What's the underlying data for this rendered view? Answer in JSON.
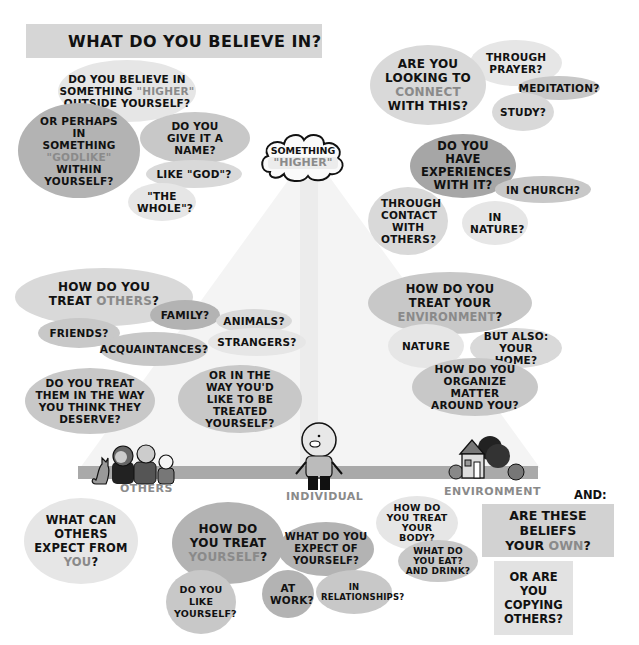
{
  "title": "WHAT DO YOU BELIEVE IN?",
  "colors": {
    "bubble_light": "#e6e6e6",
    "bubble_mid": "#c8c8c8",
    "bubble_dark": "#a6a6a6",
    "highlight_text": "#8a8a8a",
    "base_bar": "#a9a9a9"
  },
  "center": {
    "cloud_line1": "SOMETHING",
    "cloud_line2": "\"HIGHER\""
  },
  "top_left": {
    "b1": {
      "pre": "DO YOU BELIEVE IN SOMETHING",
      "hl": "\"HIGHER\"",
      "post": "OUTSIDE YOURSELF?"
    },
    "b2": {
      "pre": "OR PERHAPS IN SOMETHING",
      "hl": "\"GODLIKE\"",
      "post": "WITHIN YOURSELF?"
    },
    "b3": "DO YOU GIVE IT A NAME?",
    "b4": "LIKE \"GOD\"?",
    "b5": "\"THE WHOLE\"?"
  },
  "top_right": {
    "b1": {
      "pre": "ARE YOU LOOKING TO",
      "hl": "CONNECT",
      "post": "WITH THIS?"
    },
    "b2": "THROUGH PRAYER?",
    "b3": "MEDITATION?",
    "b4": "STUDY?",
    "b5": "DO YOU HAVE EXPERIENCES WITH IT?",
    "b6": "IN CHURCH?",
    "b7": "THROUGH CONTACT WITH OTHERS?",
    "b8": "IN NATURE?"
  },
  "mid_left": {
    "b1": {
      "pre": "HOW DO YOU TREAT",
      "hl": "OTHERS",
      "post": "?"
    },
    "b2": "FAMILY?",
    "b3": "ANIMALS?",
    "b4": "FRIENDS?",
    "b5": "ACQUAINTANCES?",
    "b6": "STRANGERS?",
    "b7": "DO YOU TREAT THEM IN THE WAY YOU THINK THEY DESERVE?",
    "b8": "OR IN THE WAY YOU'D LIKE TO BE TREATED YOURSELF?"
  },
  "mid_right": {
    "b1": {
      "pre": "HOW DO YOU TREAT YOUR",
      "hl": "ENVIRONMENT",
      "post": "?"
    },
    "b2": "NATURE",
    "b3": "BUT ALSO: YOUR HOME?",
    "b4": "HOW DO YOU ORGANIZE MATTER AROUND YOU?"
  },
  "base": {
    "others": "OTHERS",
    "individual": "INDIVIDUAL",
    "environment": "ENVIRONMENT"
  },
  "bottom": {
    "others_q": {
      "pre": "WHAT CAN OTHERS EXPECT FROM",
      "hl": "YOU",
      "post": "?"
    },
    "self_q": {
      "pre": "HOW DO YOU TREAT",
      "hl": "YOURSELF",
      "post": "?"
    },
    "like_q": "DO YOU LIKE YOURSELF?",
    "expect_q": "WHAT DO YOU EXPECT OF YOURSELF?",
    "work_q": "AT WORK?",
    "rel_q": "IN RELATIONSHIPS?",
    "body_q": "HOW DO YOU TREAT YOUR BODY?",
    "eat_q": "WHAT DO YOU EAT? AND DRINK?",
    "and_label": "AND:",
    "beliefs_box": {
      "pre": "ARE THESE BELIEFS YOUR",
      "hl": "OWN",
      "post": "?"
    },
    "copy_box": "OR ARE YOU COPYING OTHERS?"
  }
}
